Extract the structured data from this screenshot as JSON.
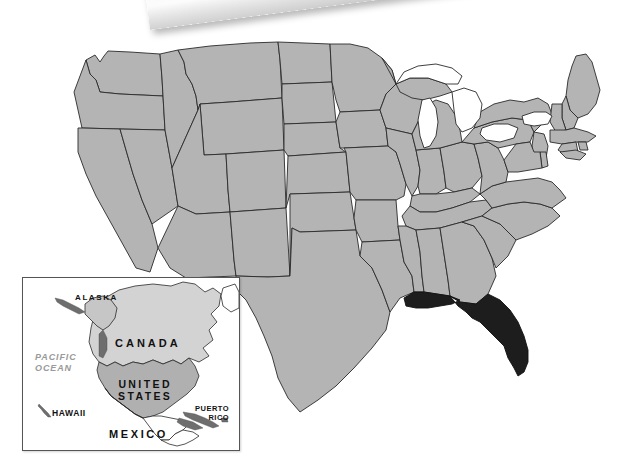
{
  "page": {
    "background_color": "#ffffff",
    "width": 640,
    "height": 466
  },
  "colors": {
    "state_fill": "#b4b4b4",
    "state_border": "#2a2a2a",
    "highlight_fill": "#1d1d1d",
    "lake_fill": "#ffffff",
    "inset_canada_fill": "#d3d3d3",
    "inset_us_fill": "#b0b0b0",
    "inset_other_fill": "#ffffff",
    "ocean_label_color": "#9a9a9a",
    "inset_border": "#555555"
  },
  "main_map": {
    "name": "contiguous-united-states",
    "highlighted_state": "Florida",
    "lakes": [
      "Lake Superior",
      "Lake Michigan",
      "Lake Huron",
      "Lake Erie",
      "Lake Ontario"
    ]
  },
  "inset": {
    "name": "north-america-locator",
    "labels": [
      {
        "id": "alaska",
        "text": "ALASKA"
      },
      {
        "id": "canada",
        "text": "CANADA"
      },
      {
        "id": "pacific",
        "text": "PACIFIC\nOCEAN"
      },
      {
        "id": "united",
        "text": "UNITED\nSTATES"
      },
      {
        "id": "hawaii",
        "text": "HAWAII"
      },
      {
        "id": "puerto",
        "text": "PUERTO\nRICO"
      },
      {
        "id": "mexico",
        "text": "MEXICO"
      }
    ]
  },
  "paper_strip": {
    "name": "cropped-paper-label",
    "description": "partially visible tilted white paper strip with black marks"
  }
}
